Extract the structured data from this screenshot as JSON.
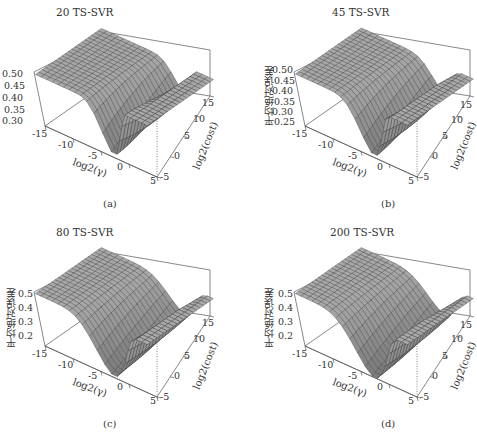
{
  "chart_data": [
    {
      "type": "surface3d",
      "panel": "a",
      "title": "20 TS-SVR",
      "caption": "(a)",
      "xlabel": "log2(γ)",
      "ylabel": "log2(cost)",
      "zlabel": "",
      "xticks": [
        "-15",
        "-10",
        "-5",
        "0",
        "5"
      ],
      "yticks": [
        "-5",
        "0",
        "5",
        "10",
        "15"
      ],
      "zticks": [
        "0.30",
        "0.35",
        "0.40",
        "0.45",
        "0.50"
      ],
      "xlim": [
        -15,
        5
      ],
      "ylim": [
        -5,
        15
      ],
      "zlim": [
        0.29,
        0.51
      ],
      "description": "Plateau at ~0.50 for low gamma, sharp valley minimum ~0.30 near log2(gamma)≈-2, rising back to 0.50 at high gamma"
    },
    {
      "type": "surface3d",
      "panel": "b",
      "title": "45 TS-SVR",
      "caption": "(b)",
      "xlabel": "log2(γ)",
      "ylabel": "log2(cost)",
      "zlabel": "平均绝对误差",
      "xticks": [
        "-15",
        "-10",
        "-5",
        "0",
        "5"
      ],
      "yticks": [
        "-5",
        "0",
        "5",
        "10",
        "15"
      ],
      "zticks": [
        "0.25",
        "0.30",
        "0.35",
        "0.40",
        "0.45",
        "0.50"
      ],
      "xlim": [
        -15,
        5
      ],
      "ylim": [
        -5,
        15
      ],
      "zlim": [
        0.24,
        0.51
      ],
      "description": "Plateau at ~0.50, valley minimum ~0.25"
    },
    {
      "type": "surface3d",
      "panel": "c",
      "title": "80 TS-SVR",
      "caption": "(c)",
      "xlabel": "log2(γ)",
      "ylabel": "log2(cost)",
      "zlabel": "平均绝对误差",
      "xticks": [
        "-15",
        "-10",
        "-5",
        "0",
        "5"
      ],
      "yticks": [
        "-5",
        "0",
        "5",
        "10",
        "15"
      ],
      "zticks": [
        "0.2",
        "0.3",
        "0.4",
        "0.5"
      ],
      "xlim": [
        -15,
        5
      ],
      "ylim": [
        -5,
        15
      ],
      "zlim": [
        0.17,
        0.51
      ],
      "description": "Plateau at ~0.5, broad valley minimum ~0.18"
    },
    {
      "type": "surface3d",
      "panel": "d",
      "title": "200 TS-SVR",
      "caption": "(d)",
      "xlabel": "log2(γ)",
      "ylabel": "log2(cost)",
      "zlabel": "平均绝对误差",
      "xticks": [
        "-15",
        "-10",
        "-5",
        "0",
        "5"
      ],
      "yticks": [
        "-5",
        "0",
        "5",
        "10",
        "15"
      ],
      "zticks": [
        "0.2",
        "0.3",
        "0.4",
        "0.5"
      ],
      "xlim": [
        -15,
        5
      ],
      "ylim": [
        -5,
        15
      ],
      "zlim": [
        0.17,
        0.51
      ],
      "description": "Plateau at ~0.5, broad valley minimum ~0.17"
    }
  ]
}
